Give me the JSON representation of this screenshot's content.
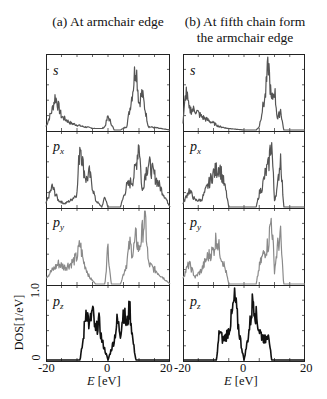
{
  "figure": {
    "title_a": "(a) At armchair edge",
    "title_b_line1": "(b) At fifth chain form",
    "title_b_line2": "the armchair edge",
    "ylabel": "DOS[1/eV]",
    "ytick_top": "1.0",
    "ytick_bottom": "0",
    "xlabel_var": "E",
    "xlabel_unit": " [eV]",
    "xticks_a": [
      "-20",
      "0",
      "20"
    ],
    "xticks_b": [
      "-20",
      "0",
      "20"
    ],
    "orbitals": [
      "s",
      "p",
      "p",
      "p"
    ],
    "orbital_subs": [
      "",
      "x",
      "y",
      "z"
    ]
  },
  "colors": {
    "s": "#555555",
    "px": "#555555",
    "py": "#8a8a8a",
    "pz": "#111111",
    "axis": "#222222"
  },
  "chart_data": {
    "type": "line",
    "xlabel": "E [eV]",
    "ylabel": "DOS [1/eV]",
    "xlim": [
      -20,
      20
    ],
    "ylim": [
      0,
      1.0
    ],
    "grid": false,
    "panels": [
      {
        "column": "(a) At armchair edge",
        "rows": [
          {
            "orbital": "s",
            "x": [
              -20,
              -18,
              -17,
              -15,
              -12,
              -8,
              -4,
              -2,
              -1,
              0,
              2,
              4,
              6,
              7,
              8,
              9,
              10,
              11,
              12,
              13,
              20
            ],
            "y": [
              0.05,
              0.3,
              0.5,
              0.2,
              0.1,
              0.05,
              0.02,
              0.02,
              0.05,
              0.2,
              0.0,
              0.0,
              0.05,
              0.3,
              0.6,
              1.0,
              0.4,
              0.55,
              0.3,
              0.05,
              0.0
            ]
          },
          {
            "orbital": "px",
            "x": [
              -20,
              -18,
              -16,
              -14,
              -12,
              -10,
              -9,
              -8,
              -7,
              -6,
              -4,
              -2,
              -1,
              0,
              4,
              6,
              8,
              9,
              10,
              11,
              12,
              13,
              20
            ],
            "y": [
              0.05,
              0.3,
              0.1,
              0.05,
              0.1,
              0.2,
              1.0,
              0.6,
              0.4,
              0.5,
              0.1,
              0.0,
              0.15,
              0.0,
              0.0,
              0.3,
              0.4,
              0.6,
              1.0,
              0.2,
              0.5,
              0.65,
              0.0
            ]
          },
          {
            "orbital": "py",
            "x": [
              -20,
              -18,
              -16,
              -14,
              -12,
              -10,
              -9,
              -8,
              -6,
              -4,
              -1,
              0,
              1,
              4,
              6,
              7,
              8,
              9,
              10,
              11,
              12,
              13,
              20
            ],
            "y": [
              0.1,
              0.2,
              0.3,
              0.25,
              0.3,
              0.4,
              0.6,
              0.35,
              0.1,
              0.0,
              0.0,
              0.55,
              0.0,
              0.0,
              0.3,
              0.6,
              0.45,
              0.7,
              0.5,
              0.75,
              1.0,
              0.3,
              0.0
            ]
          },
          {
            "orbital": "pz",
            "x": [
              -20,
              -9,
              -8,
              -7,
              -6,
              -5,
              -4,
              -3,
              -2,
              -1,
              0,
              1,
              2,
              3,
              4,
              5,
              6,
              7,
              8,
              9,
              20
            ],
            "y": [
              0,
              0,
              0.3,
              0.8,
              0.5,
              0.75,
              0.4,
              0.6,
              0.3,
              0.15,
              0.0,
              0.15,
              0.3,
              0.6,
              0.4,
              0.75,
              0.5,
              0.8,
              0.3,
              0,
              0
            ]
          }
        ]
      },
      {
        "column": "(b) At fifth chain form the armchair edge",
        "rows": [
          {
            "orbital": "s",
            "x": [
              -20,
              -19,
              -18,
              -16,
              -14,
              -12,
              -10,
              -8,
              -5,
              0,
              4,
              5,
              6,
              7,
              8,
              9,
              10,
              11,
              12,
              13,
              20
            ],
            "y": [
              0.1,
              0.6,
              0.3,
              0.3,
              0.2,
              0.15,
              0.1,
              0.05,
              0.02,
              0.0,
              0.0,
              0.05,
              0.3,
              0.5,
              1.0,
              0.4,
              0.6,
              0.15,
              0.3,
              0.0,
              0.0
            ]
          },
          {
            "orbital": "px",
            "x": [
              -20,
              -18,
              -16,
              -14,
              -12,
              -10,
              -8,
              -6,
              -5,
              0,
              4,
              5,
              6,
              7,
              8,
              9,
              10,
              11,
              12,
              13,
              20
            ],
            "y": [
              0.05,
              0.25,
              0.1,
              0.1,
              0.3,
              0.5,
              0.6,
              0.25,
              0.0,
              0.0,
              0.0,
              0.2,
              0.3,
              0.5,
              0.6,
              1.0,
              0.1,
              0.3,
              0.75,
              0.0,
              0.0
            ]
          },
          {
            "orbital": "py",
            "x": [
              -20,
              -18,
              -16,
              -14,
              -12,
              -10,
              -9,
              -8,
              -6,
              -5,
              0,
              4,
              5,
              6,
              7,
              8,
              9,
              10,
              11,
              12,
              13,
              20
            ],
            "y": [
              0.1,
              0.3,
              0.1,
              0.2,
              0.4,
              0.5,
              0.7,
              0.5,
              0.2,
              0.0,
              0.0,
              0.0,
              0.25,
              0.4,
              0.5,
              0.6,
              1.0,
              0.2,
              0.55,
              0.7,
              0.0,
              0.0
            ]
          },
          {
            "orbital": "pz",
            "x": [
              -20,
              -9,
              -8,
              -7,
              -6,
              -5,
              -4,
              -3,
              -2,
              -1,
              0,
              1,
              2,
              3,
              4,
              5,
              6,
              7,
              8,
              9,
              20
            ],
            "y": [
              0,
              0,
              0.45,
              0.3,
              0.35,
              0.45,
              0.65,
              0.95,
              0.55,
              0.25,
              0.0,
              0.25,
              0.55,
              0.95,
              0.65,
              0.45,
              0.35,
              0.3,
              0.45,
              0,
              0
            ]
          }
        ]
      }
    ]
  }
}
